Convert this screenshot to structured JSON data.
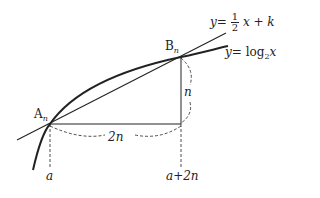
{
  "diagram": {
    "line_label": {
      "y": "y",
      "eq": "=",
      "num": "1",
      "den": "2",
      "rest": "x + k"
    },
    "curve_label": {
      "y": "y",
      "eq": "= log",
      "base": "2",
      "x": "x"
    },
    "point_a": {
      "name": "A",
      "sub": "n"
    },
    "point_b": {
      "name": "B",
      "sub": "n"
    },
    "horizontal_length": "2n",
    "vertical_length": "n",
    "x_tick_a": "a",
    "x_tick_b": "a+2n"
  }
}
